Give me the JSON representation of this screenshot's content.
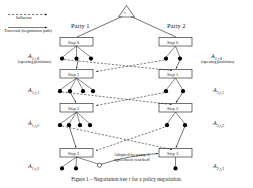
{
  "figure": {
    "caption_prefix": "Figure 1 – Negotiation tree",
    "caption_symbol": "r",
    "caption_suffix": "for a policy negotiation."
  },
  "legend": {
    "influence_label": "Influence",
    "traversal_label": "Traversal (negotiation path)"
  },
  "root": {
    "label": "r"
  },
  "parties": [
    {
      "name": "party-1",
      "label": "Party 1"
    },
    {
      "name": "party-2",
      "label": "Party 2"
    }
  ],
  "steps": {
    "left": [
      {
        "label": "Step 0"
      },
      {
        "label": "Step 1"
      },
      {
        "label": "Step 2"
      },
      {
        "label": "Step 3"
      }
    ],
    "right": [
      {
        "label": "Step 0"
      },
      {
        "label": "Step 1"
      },
      {
        "label": "Step 2"
      },
      {
        "label": "Step 3"
      }
    ]
  },
  "action_sets": {
    "left": [
      {
        "label": "A",
        "sub": "1,r,0",
        "note": "(opening positions)"
      },
      {
        "label": "A",
        "sub": "1,r,1",
        "note": ""
      },
      {
        "label": "A",
        "sub": "1,r,2",
        "note": ""
      },
      {
        "label": "A",
        "sub": "1,r,3",
        "note": ""
      }
    ],
    "right": [
      {
        "label": "A",
        "sub": "2,r,0",
        "note": "(opening positions)"
      },
      {
        "label": "A",
        "sub": "2,r,1",
        "note": ""
      },
      {
        "label": "A",
        "sub": "2,r,2",
        "note": ""
      },
      {
        "label": "A",
        "sub": "2,r,3",
        "note": ""
      }
    ]
  },
  "annotation": {
    "line1": "Adopted by party 1,",
    "line2": "agreement reached!"
  },
  "colors": {
    "stroke": "#111111",
    "node_fill": "#000000",
    "agreement_fill": "#ffffff",
    "box_fill": "#ffffff",
    "text": "#1a1a1a"
  }
}
